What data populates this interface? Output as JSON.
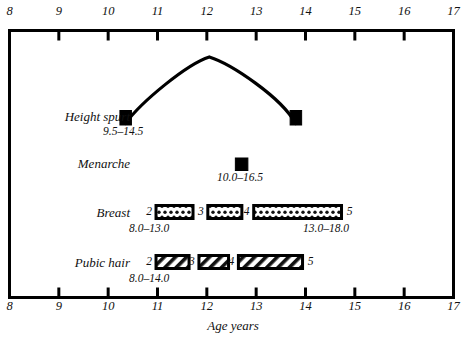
{
  "chart_data": {
    "type": "bar",
    "title": "",
    "xlabel": "Age years",
    "ylabel": "",
    "xlim": [
      8,
      17
    ],
    "xticks": [
      8,
      9,
      10,
      11,
      12,
      13,
      14,
      15,
      16,
      17
    ],
    "xtick_labels": [
      "8",
      "9",
      "10",
      "11",
      "12",
      "13",
      "14",
      "15",
      "16",
      "17"
    ],
    "grid": false,
    "legend": "none",
    "axis_top": true,
    "axis_bottom": true,
    "rows": [
      {
        "name": "Height spurt",
        "kind": "curve",
        "range_label": "9.5–14.5",
        "range_start": 9.5,
        "range_end": 14.5,
        "marker_start_age": 10.35,
        "marker_end_age": 13.8,
        "peak_age": 12.05
      },
      {
        "name": "Menarche",
        "kind": "point",
        "range_label": "10.0–16.5",
        "range_start": 10.0,
        "range_end": 16.5,
        "marker_age": 12.7
      },
      {
        "name": "Breast",
        "kind": "stage-bars",
        "fill": "dotted",
        "range_label_left": "8.0–13.0",
        "range_label_right": "13.0–18.0",
        "stage_labels": [
          "2",
          "3",
          "4",
          "5"
        ],
        "bars": [
          {
            "left_stage": "2",
            "right_stage": "3",
            "start_age": 10.97,
            "end_age": 11.72
          },
          {
            "left_stage": "3",
            "right_stage": "4",
            "start_age": 12.02,
            "end_age": 12.71
          },
          {
            "left_stage": "4",
            "right_stage": "5",
            "start_age": 12.95,
            "end_age": 14.73
          }
        ]
      },
      {
        "name": "Pubic hair",
        "kind": "stage-bars",
        "fill": "hatched",
        "range_label_left": "8.0–14.0",
        "range_label_right": "",
        "stage_labels": [
          "2",
          "3",
          "4",
          "5"
        ],
        "bars": [
          {
            "left_stage": "2",
            "right_stage": "3",
            "start_age": 10.97,
            "end_age": 11.64
          },
          {
            "left_stage": "3",
            "right_stage": "4",
            "start_age": 11.84,
            "end_age": 12.44
          },
          {
            "left_stage": "4",
            "right_stage": "5",
            "start_age": 12.64,
            "end_age": 13.94
          }
        ]
      }
    ]
  },
  "axis": {
    "caption": "Age years",
    "ticks": [
      "8",
      "9",
      "10",
      "11",
      "12",
      "13",
      "14",
      "15",
      "16",
      "17"
    ]
  },
  "rows": {
    "height_spurt": {
      "label": "Height spurt",
      "range": "9.5–14.5"
    },
    "menarche": {
      "label": "Menarche",
      "range": "10.0–16.5"
    },
    "breast": {
      "label": "Breast",
      "range_left": "8.0–13.0",
      "range_right": "13.0–18.0",
      "stages": [
        "2",
        "3",
        "4",
        "5"
      ]
    },
    "pubic_hair": {
      "label": "Pubic hair",
      "range_left": "8.0–14.0",
      "stages": [
        "2",
        "3",
        "4",
        "5"
      ]
    }
  },
  "colors": {
    "ink": "#000000",
    "background": "#ffffff"
  }
}
